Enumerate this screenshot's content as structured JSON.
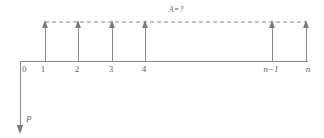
{
  "figure": {
    "title_label": "A=?",
    "vertical_axis_label": "P",
    "origin_label": "0",
    "axis_ticks": [
      {
        "label": "0",
        "x": 21
      },
      {
        "label": "1",
        "x": 45
      },
      {
        "label": "2",
        "x": 78
      },
      {
        "label": "3",
        "x": 112
      },
      {
        "label": "4",
        "x": 145
      },
      {
        "label": "n−1",
        "x": 272
      },
      {
        "label": "n",
        "x": 306
      }
    ],
    "load_lines": [
      {
        "name": "load-1",
        "x": 45
      },
      {
        "name": "load-2",
        "x": 78
      },
      {
        "name": "load-3",
        "x": 112
      },
      {
        "name": "load-4",
        "x": 145
      },
      {
        "name": "load-n-1",
        "x": 272
      },
      {
        "name": "load-n",
        "x": 306
      }
    ],
    "geometry": {
      "baseline_y": 61,
      "top_y": 22,
      "axis_x": 20,
      "axis_bottom_y": 130,
      "baseline_right_x": 308,
      "span_left_x": 45,
      "span_right_x": 306
    },
    "colors": {
      "stroke": "#8a8a8a",
      "text": "#5f5f5f",
      "background": "#ffffff"
    }
  }
}
